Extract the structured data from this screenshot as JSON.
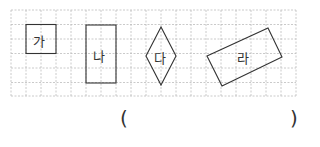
{
  "problem": {
    "shapes": [
      {
        "id": "ga",
        "label": "가",
        "type": "square"
      },
      {
        "id": "na",
        "label": "나",
        "type": "rectangle"
      },
      {
        "id": "da",
        "label": "다",
        "type": "rhombus"
      },
      {
        "id": "ra",
        "label": "라",
        "type": "rotated-rectangle"
      }
    ],
    "answer_open": "(",
    "answer_close": ")",
    "answer_value": ""
  },
  "grid": {
    "cols": 19,
    "rows": 6,
    "cell_size": 15,
    "line_color": "#b8b8b8",
    "shape_color": "#333333"
  }
}
